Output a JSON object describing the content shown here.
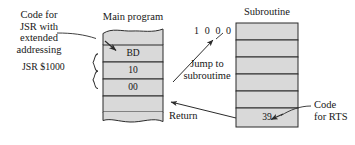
{
  "figure": {
    "kind": "jsr-rts-subroutine-call-diagram",
    "background": "#ffffff",
    "cell_fill": "#d9d9d9",
    "line_color": "#2b2b2b"
  },
  "main_program": {
    "title": "Main program",
    "cells": [
      {
        "value": "",
        "name": "main-cell-blank-top"
      },
      {
        "value": "BD",
        "name": "main-cell-bd"
      },
      {
        "value": "10",
        "name": "main-cell-10"
      },
      {
        "value": "00",
        "name": "main-cell-00"
      },
      {
        "value": "",
        "name": "main-cell-blank-bottom"
      }
    ]
  },
  "subroutine": {
    "title": "Subroutine",
    "cells": [
      {
        "value": "",
        "name": "sub-cell-1"
      },
      {
        "value": "",
        "name": "sub-cell-2"
      },
      {
        "value": "",
        "name": "sub-cell-3"
      },
      {
        "value": "",
        "name": "sub-cell-4"
      },
      {
        "value": "",
        "name": "sub-cell-5"
      },
      {
        "value": "39",
        "name": "sub-cell-39"
      }
    ]
  },
  "annotations": {
    "code_for_jsr": "Code for\nJSR with\nextended\naddressing",
    "jsr_operand": "JSR $1000",
    "target_address": "1 0 0 0",
    "jump_to_subroutine": "Jump to\nsubroutime",
    "return": "Return",
    "code_for_rts": "Code\nfor RTS"
  }
}
